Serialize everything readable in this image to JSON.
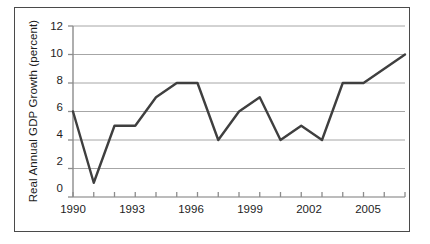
{
  "chart_data": {
    "type": "line",
    "title": "",
    "xlabel": "",
    "ylabel": "Real Annual GDP Growth (percent)",
    "x": [
      1990,
      1991,
      1992,
      1993,
      1994,
      1995,
      1996,
      1997,
      1998,
      1999,
      2000,
      2001,
      2002,
      2003,
      2004,
      2005,
      2006
    ],
    "values": [
      6,
      1,
      5,
      5,
      7,
      8,
      8,
      4,
      6,
      7,
      4,
      5,
      4,
      8,
      8,
      9,
      10
    ],
    "series": [
      {
        "name": "Real Annual GDP Growth",
        "values": [
          6,
          1,
          5,
          5,
          7,
          8,
          8,
          4,
          6,
          7,
          4,
          5,
          4,
          8,
          8,
          9,
          10
        ]
      }
    ],
    "xlim": [
      1990,
      2006
    ],
    "ylim": [
      0,
      12
    ],
    "yticks": [
      0,
      2,
      4,
      6,
      8,
      10,
      12
    ],
    "ytick_labels": [
      "0",
      "2",
      "4",
      "6",
      "8",
      "10",
      "12"
    ],
    "xticks": [
      1990,
      1991,
      1992,
      1993,
      1994,
      1995,
      1996,
      1997,
      1998,
      1999,
      2000,
      2001,
      2002,
      2003,
      2004,
      2005,
      2006
    ],
    "xtick_labels": [
      "1990",
      "",
      "",
      "1993",
      "",
      "",
      "1996",
      "",
      "",
      "1999",
      "",
      "",
      "2002",
      "",
      "",
      "2005",
      ""
    ],
    "xtick_labels_shown": [
      "1990",
      "1993",
      "1996",
      "1999",
      "2002",
      "2005"
    ],
    "grid": true,
    "grid_axis": "y",
    "legend": false,
    "colors": {
      "line": "#3f3f3f",
      "grid": "#a6a6a6",
      "axis": "#8c8c8c",
      "border": "#4a4a4a",
      "text": "#1d1d1d",
      "background": "#ffffff"
    }
  }
}
